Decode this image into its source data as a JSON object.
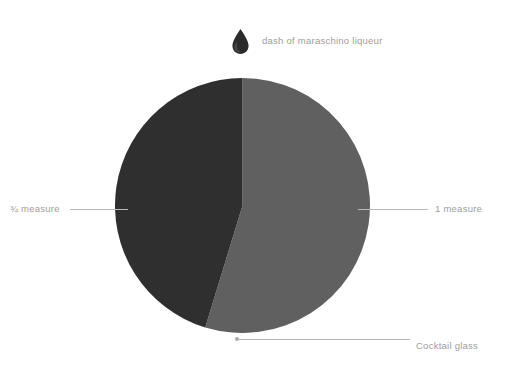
{
  "canvas": {
    "width": 507,
    "height": 366,
    "background": "#ffffff"
  },
  "key": {
    "icon": "droplet-icon",
    "icon_color": "#2b2b2b",
    "label": "dash of maraschino liqueur"
  },
  "callouts": {
    "left": {
      "label": "¾ measure"
    },
    "right": {
      "label": "1 measure"
    },
    "bottom": {
      "label": "Cocktail glass"
    }
  },
  "chart_data": {
    "type": "pie",
    "title": "",
    "xlabel": "",
    "ylabel": "",
    "legend_position": "callouts",
    "grid": false,
    "units": "measures",
    "total": 1.75,
    "start_angle_deg": 0,
    "direction": "clockwise",
    "categories": [
      "1 measure",
      "¾ measure"
    ],
    "values": [
      1,
      0.75
    ],
    "percentages": [
      57.1,
      42.9
    ],
    "sweep_degrees": [
      197,
      163
    ],
    "colors": [
      "#606060",
      "#2f2f2f"
    ],
    "series": [
      {
        "name": "Cocktail proportions",
        "values": [
          1,
          0.75
        ]
      }
    ],
    "annotations": [
      {
        "text": "dash of maraschino liqueur",
        "marker": "droplet-icon",
        "position": "above-chart"
      },
      {
        "text": "Cocktail glass",
        "marker": "leader-line-with-dot",
        "position": "bottom-right",
        "points_to": "pie-outline"
      }
    ],
    "geometry": {
      "center_x": 242.5,
      "center_y": 205.5,
      "radius": 127.5
    }
  },
  "colors": {
    "segment_gray": "#606060",
    "segment_dark": "#2f2f2f",
    "label_text": "#9d9d9d",
    "leader_line": "#b9b9b9",
    "background": "#ffffff"
  }
}
